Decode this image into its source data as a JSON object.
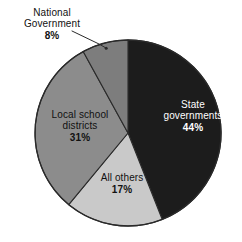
{
  "chart_data": {
    "type": "pie",
    "title": "",
    "subtitle": "",
    "xlabel": "",
    "ylabel": "",
    "legend_position": "none",
    "grid": false,
    "categories": [
      "State governments",
      "All others",
      "Local school districts",
      "National Government"
    ],
    "values": [
      44,
      17,
      31,
      8
    ],
    "value_suffix": "%",
    "slices": [
      {
        "label": "State governments",
        "label_line1": "State",
        "label_line2": "governments",
        "value": 44,
        "value_text": "44%",
        "color": "#1c1c1c",
        "text_color": "#ffffff",
        "label_placement": "inside",
        "start_angle_deg": 0,
        "end_angle_deg": 158.4
      },
      {
        "label": "All others",
        "label_line1": "All others",
        "label_line2": "",
        "value": 17,
        "value_text": "17%",
        "color": "#c9c9c9",
        "text_color": "#111111",
        "label_placement": "inside",
        "start_angle_deg": 158.4,
        "end_angle_deg": 219.6
      },
      {
        "label": "Local school districts",
        "label_line1": "Local school",
        "label_line2": "districts",
        "value": 31,
        "value_text": "31%",
        "color": "#8c8c8c",
        "text_color": "#111111",
        "label_placement": "inside",
        "start_angle_deg": 219.6,
        "end_angle_deg": 331.2
      },
      {
        "label": "National Government",
        "label_line1": "National",
        "label_line2": "Government",
        "value": 8,
        "value_text": "8%",
        "color": "#7d7d7d",
        "text_color": "#111111",
        "label_placement": "outside-callout",
        "start_angle_deg": 331.2,
        "end_angle_deg": 360
      }
    ],
    "geometry": {
      "center_x": 128,
      "center_y": 133,
      "radius": 93,
      "outline_color": "#2a2a2a"
    }
  },
  "colors": {
    "background": "#ffffff",
    "state_governments": "#1c1c1c",
    "all_others": "#c9c9c9",
    "local_school_districts": "#8c8c8c",
    "national_government": "#7d7d7d",
    "outline": "#2a2a2a",
    "leader_line": "#2a2a2a"
  }
}
